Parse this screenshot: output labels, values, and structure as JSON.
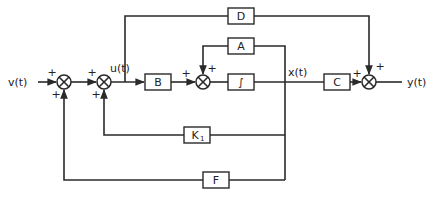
{
  "signals": {
    "input": "v(t)",
    "control": "u(t)",
    "state": "x(t)",
    "output": "y(t)"
  },
  "blocks": {
    "B": "B",
    "A": "A",
    "integrator": "∫",
    "C": "C",
    "D": "D",
    "K1": "K",
    "K1_sub": "1",
    "F": "F"
  },
  "signs": {
    "sum1_left": "+",
    "sum1_bottom": "+",
    "sum2_left": "+",
    "sum2_bottom": "+",
    "sum3_left": "+",
    "sum3_top": "+",
    "sum4_left": "+",
    "sum4_top": "+"
  },
  "colors": {
    "line": "#2a2a2a",
    "background": "#ffffff"
  }
}
